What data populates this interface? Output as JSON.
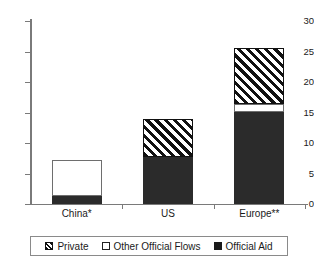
{
  "chart_data": {
    "type": "bar",
    "title": "",
    "xlabel": "",
    "ylabel": "",
    "ylim": [
      0,
      30
    ],
    "yticks": [
      0,
      5,
      10,
      15,
      20,
      25,
      30
    ],
    "ytick_labels": [
      "0",
      "5",
      "10",
      "15",
      "20",
      "25",
      "30"
    ],
    "grid": false,
    "stacked": true,
    "legend_position": "bottom",
    "categories": [
      "China*",
      "US",
      "Europe**"
    ],
    "series": [
      {
        "name": "Official Aid",
        "values": [
          1.3,
          7.7,
          15.1
        ]
      },
      {
        "name": "Other Official Flows",
        "values": [
          5.9,
          0.0,
          1.3
        ]
      },
      {
        "name": "Private",
        "values": [
          0.0,
          6.3,
          9.2
        ]
      }
    ],
    "totals": [
      7.2,
      14.0,
      25.6
    ],
    "series_styles": [
      {
        "name": "Official Aid",
        "fill": "solid",
        "color": "#2b2b2b"
      },
      {
        "name": "Other Official Flows",
        "fill": "hollow",
        "color": "#ffffff"
      },
      {
        "name": "Private",
        "fill": "hatch",
        "color": "#111111"
      }
    ]
  },
  "legend": {
    "items": [
      {
        "label": "Private",
        "swatch": "hatched-square-icon"
      },
      {
        "label": "Other Official Flows",
        "swatch": "hollow-square-icon"
      },
      {
        "label": "Official Aid",
        "swatch": "solid-square-icon"
      }
    ]
  },
  "axis": {
    "y_ticks": [
      "0",
      "5",
      "10",
      "15",
      "20",
      "25",
      "30"
    ],
    "x_labels": [
      "China*",
      "US",
      "Europe**"
    ]
  },
  "colors": {
    "axis": "#7a7a7a",
    "official_aid": "#2b2b2b",
    "other_official_flows": "#ffffff",
    "private": "#111111",
    "background": "#ffffff"
  }
}
